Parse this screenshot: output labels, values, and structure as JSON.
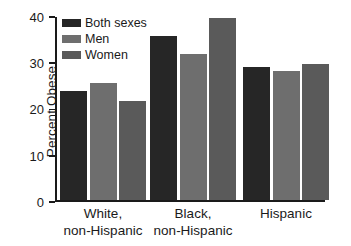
{
  "chart_data": {
    "type": "bar",
    "title": "",
    "xlabel": "",
    "ylabel": "Percent Obese",
    "ylim": [
      0,
      40
    ],
    "yticks": [
      0,
      10,
      20,
      30,
      40
    ],
    "grid": false,
    "legend_position": "top-left",
    "categories": [
      "White, non-Hispanic",
      "Black, non-Hispanic",
      "Hispanic"
    ],
    "category_lines": [
      [
        "White,",
        "non-Hispanic"
      ],
      [
        "Black,",
        "non-Hispanic"
      ],
      [
        "Hispanic",
        ""
      ]
    ],
    "series": [
      {
        "name": "Both sexes",
        "color": "#262626",
        "values": [
          23.6,
          35.5,
          28.8
        ]
      },
      {
        "name": "Men",
        "color": "#6e6e6e",
        "values": [
          25.3,
          31.6,
          27.9
        ]
      },
      {
        "name": "Women",
        "color": "#5a5a5a",
        "values": [
          21.6,
          39.4,
          29.4
        ]
      }
    ]
  },
  "axis": {
    "y_tick_labels": [
      "0",
      "10",
      "20",
      "30",
      "40"
    ],
    "y_axis_title": "Percent Obese"
  },
  "legend": {
    "items": [
      {
        "label": "Both sexes"
      },
      {
        "label": "Men"
      },
      {
        "label": "Women"
      }
    ]
  }
}
